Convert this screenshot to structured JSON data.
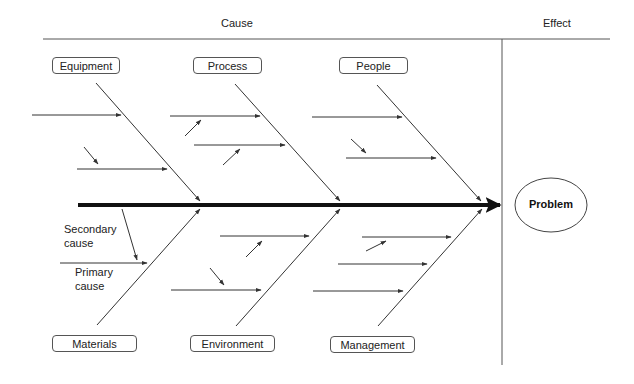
{
  "header": {
    "cause_label": "Cause",
    "effect_label": "Effect"
  },
  "effect": {
    "label": "Problem"
  },
  "categories": {
    "top": [
      {
        "label": "Equipment"
      },
      {
        "label": "Process"
      },
      {
        "label": "People"
      }
    ],
    "bottom": [
      {
        "label": "Materials"
      },
      {
        "label": "Environment"
      },
      {
        "label": "Management"
      }
    ]
  },
  "annotations": {
    "secondary_cause_line1": "Secondary",
    "secondary_cause_line2": "cause",
    "primary_cause_line1": "Primary",
    "primary_cause_line2": "cause"
  },
  "colors": {
    "line": "#333333",
    "spine": "#111111",
    "box_border": "#555555"
  }
}
